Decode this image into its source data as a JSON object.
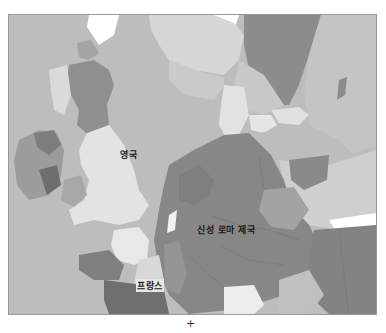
{
  "map": {
    "style": "grayscale historical political map",
    "region": "Western and Central Europe",
    "labels": {
      "england": "영국",
      "holy_roman_empire": "신성 로마 제국",
      "france": "프랑스"
    },
    "below_mark": "+",
    "colors": {
      "sea": "#bdbdbd",
      "england": "#e3e3e3",
      "scotland": "#8f8f8f",
      "ireland": "#9c9c9c",
      "holy_roman_empire": "#878787",
      "france_light": "#e8e8e8",
      "france_dark": "#7f7f7f",
      "scandinavia_dark": "#8c8c8c",
      "scandinavia_light": "#c4c4c4",
      "poland": "#cfcfcf",
      "hungary": "#838383",
      "unmapped_white": "#ffffff"
    }
  }
}
